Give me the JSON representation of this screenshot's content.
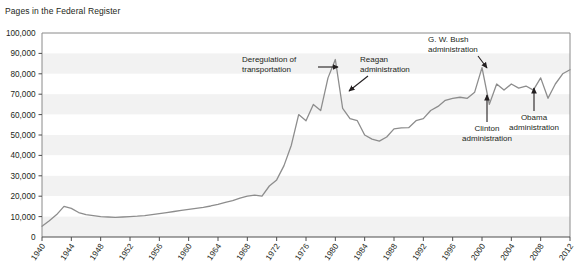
{
  "chart_data": {
    "type": "line",
    "title": "Pages in the Federal Register",
    "xlabel": "",
    "ylabel": "",
    "xlim": [
      1940,
      2012
    ],
    "ylim": [
      0,
      100000
    ],
    "grid": "horizontal-banded",
    "legend": "none",
    "ytick_labels": [
      "100,000",
      "90,000",
      "80,000",
      "70,000",
      "60,000",
      "50,000",
      "40,000",
      "30,000",
      "20,000",
      "10,000",
      "0"
    ],
    "ytick_values": [
      100000,
      90000,
      80000,
      70000,
      60000,
      50000,
      40000,
      30000,
      20000,
      10000,
      0
    ],
    "xtick_labels": [
      "1940",
      "1944",
      "1948",
      "1952",
      "1956",
      "1960",
      "1964",
      "1968",
      "1972",
      "1976",
      "1980",
      "1984",
      "1988",
      "1992",
      "1996",
      "2000",
      "2004",
      "2008",
      "2012"
    ],
    "xtick_values": [
      1940,
      1944,
      1948,
      1952,
      1956,
      1960,
      1964,
      1968,
      1972,
      1976,
      1980,
      1984,
      1988,
      1992,
      1996,
      2000,
      2004,
      2008,
      2012
    ],
    "line_color": "#8d8d8d",
    "x": [
      1940,
      1941,
      1942,
      1943,
      1944,
      1945,
      1946,
      1947,
      1948,
      1949,
      1950,
      1951,
      1952,
      1953,
      1954,
      1955,
      1956,
      1957,
      1958,
      1959,
      1960,
      1961,
      1962,
      1963,
      1964,
      1965,
      1966,
      1967,
      1968,
      1969,
      1970,
      1971,
      1972,
      1973,
      1974,
      1975,
      1976,
      1977,
      1978,
      1979,
      1980,
      1981,
      1982,
      1983,
      1984,
      1985,
      1986,
      1987,
      1988,
      1989,
      1990,
      1991,
      1992,
      1993,
      1994,
      1995,
      1996,
      1997,
      1998,
      1999,
      2000,
      2001,
      2002,
      2003,
      2004,
      2005,
      2006,
      2007,
      2008,
      2009,
      2010,
      2011,
      2012
    ],
    "values": [
      5300,
      8000,
      11000,
      15000,
      14000,
      12000,
      11000,
      10500,
      10000,
      9800,
      9600,
      9800,
      10000,
      10200,
      10500,
      11000,
      11500,
      12000,
      12500,
      13000,
      13500,
      14000,
      14500,
      15200,
      16000,
      17000,
      17800,
      19000,
      20000,
      20500,
      20000,
      25000,
      28000,
      35000,
      45000,
      60000,
      57000,
      65000,
      62000,
      78000,
      87000,
      63000,
      58000,
      57000,
      50000,
      48000,
      47000,
      49000,
      53000,
      53500,
      53600,
      57000,
      58000,
      62000,
      64000,
      67000,
      68000,
      68500,
      68000,
      71000,
      83000,
      65000,
      75000,
      72000,
      75000,
      73000,
      74000,
      72000,
      78000,
      68000,
      75000,
      80000,
      82000
    ],
    "annotations": [
      {
        "label": "Deregulation of transportation",
        "arrow": "right",
        "target_year": 1980,
        "target_value": 87000
      },
      {
        "label": "Reagan administration",
        "arrow": "down-left",
        "target_year": 1981,
        "target_value": 70000
      },
      {
        "label": "G. W. Bush administration",
        "arrow": "down-right",
        "target_year": 2000,
        "target_value": 83000
      },
      {
        "label": "Clinton administration",
        "arrow": "up",
        "target_year": 1993,
        "target_value": 62000
      },
      {
        "label": "Obama administration",
        "arrow": "up",
        "target_year": 2009,
        "target_value": 68000
      }
    ]
  },
  "annotation_text": {
    "dereg_line1": "Deregulation of",
    "dereg_line2": "transportation",
    "reagan_line1": "Reagan",
    "reagan_line2": "administration",
    "bush_line1": "G. W. Bush",
    "bush_line2": "administration",
    "clinton_line1": "Clinton",
    "clinton_line2": "administration",
    "obama_line1": "Obama",
    "obama_line2": "administration"
  }
}
